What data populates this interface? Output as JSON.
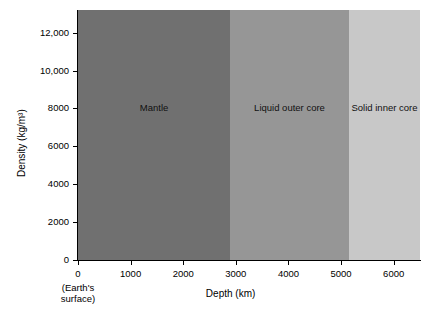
{
  "chart_data": {
    "type": "line",
    "title": "",
    "xlabel": "Depth (km)",
    "ylabel": "Density (kg/m³)",
    "xlim": [
      0,
      6500
    ],
    "ylim": [
      0,
      13200
    ],
    "grid": false,
    "legend": "none",
    "xticks": [
      0,
      1000,
      2000,
      3000,
      4000,
      5000,
      6000
    ],
    "xticklabels": [
      "0",
      "1000",
      "2000",
      "3000",
      "4000",
      "5000",
      "6000"
    ],
    "yticks": [
      0,
      2000,
      4000,
      6000,
      8000,
      10000,
      12000
    ],
    "yticklabels": [
      "0",
      "2000",
      "4000",
      "6000",
      "8000",
      "10,000",
      "12,000"
    ],
    "origin_annotation": [
      "(Earth's",
      "surface)"
    ],
    "series": [
      {
        "name": "Density",
        "color": "#333333",
        "x": [
          0,
          400,
          400,
          500,
          670,
          670,
          800,
          820,
          1200,
          1800,
          2400,
          2890,
          2890,
          3200,
          3800,
          4400,
          5000,
          5150,
          5600,
          6100,
          6371
        ],
        "values": [
          3300,
          3300,
          3950,
          3990,
          4100,
          4900,
          5000,
          5050,
          5200,
          5380,
          5550,
          5700,
          10000,
          10600,
          11200,
          11600,
          11900,
          12100,
          12250,
          12350,
          12400
        ]
      }
    ],
    "regions": [
      {
        "name": "Mantle",
        "label": "Mantle",
        "x_start": 0,
        "x_end": 2890,
        "color": "#707070",
        "label_y": 8000
      },
      {
        "name": "Liquid outer core",
        "label": "Liquid outer core",
        "x_start": 2890,
        "x_end": 5150,
        "color": "#969696",
        "label_y": 8000
      },
      {
        "name": "Solid inner core",
        "label": "Solid inner core",
        "x_start": 5150,
        "x_end": 6500,
        "color": "#c8c8c8",
        "label_y": 8000
      }
    ]
  }
}
